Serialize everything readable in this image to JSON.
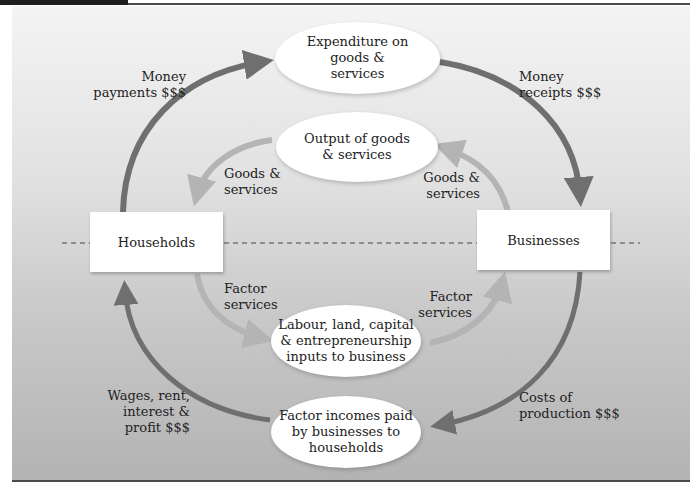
{
  "diagram": {
    "type": "circular-flow",
    "colors": {
      "money_arrow": "#6f6f6f",
      "real_arrow": "#b4b4b4",
      "panel_top": "#f4f4f4",
      "panel_bottom": "#b3b3b3",
      "box_fill": "#ffffff",
      "rule": "#4a4a4a"
    },
    "sectors": {
      "households": "Households",
      "businesses": "Businesses"
    },
    "markets": {
      "expenditure": "Expenditure on\ngoods &\nservices",
      "output": "Output of goods\n& services",
      "inputs": "Labour, land, capital\n& entrepreneurship\ninputs to business",
      "incomes": "Factor incomes paid\nby businesses to\nhouseholds"
    },
    "flow_labels": {
      "money_payments": "Money\npayments $$$",
      "money_receipts": "Money\nreceipts $$$",
      "goods_to_households": "Goods &\nservices",
      "goods_from_businesses": "Goods &\nservices",
      "factor_from_households": "Factor\nservices",
      "factor_to_businesses": "Factor\nservices",
      "wages": "Wages, rent,\ninterest &\nprofit $$$",
      "costs": "Costs of\nproduction $$$"
    }
  }
}
